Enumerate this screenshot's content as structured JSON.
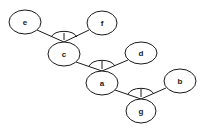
{
  "diagram": {
    "type": "and-tree",
    "nodes": [
      {
        "id": "e",
        "label": "e",
        "cx": 25,
        "cy": 22,
        "rx": 16,
        "ry": 12
      },
      {
        "id": "f",
        "label": "f",
        "cx": 102,
        "cy": 23,
        "rx": 15,
        "ry": 12
      },
      {
        "id": "c",
        "label": "c",
        "cx": 64,
        "cy": 54,
        "rx": 16,
        "ry": 12
      },
      {
        "id": "d",
        "label": "d",
        "cx": 141,
        "cy": 53,
        "rx": 16,
        "ry": 11
      },
      {
        "id": "a",
        "label": "a",
        "cx": 102,
        "cy": 83,
        "rx": 16,
        "ry": 12
      },
      {
        "id": "b",
        "label": "b",
        "cx": 180,
        "cy": 81,
        "rx": 16,
        "ry": 12
      },
      {
        "id": "g",
        "label": "g",
        "cx": 141,
        "cy": 111,
        "rx": 15,
        "ry": 12
      }
    ],
    "and_groups": [
      {
        "parent": "c",
        "children": [
          "e",
          "f"
        ]
      },
      {
        "parent": "a",
        "children": [
          "c",
          "d"
        ]
      },
      {
        "parent": "g",
        "children": [
          "a",
          "b"
        ]
      }
    ]
  }
}
